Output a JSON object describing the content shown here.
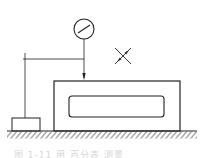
{
  "diagram": {
    "type": "measurement-setup",
    "elements": [
      {
        "id": "dial-indicator",
        "label": "dial indicator"
      },
      {
        "id": "indicator-stand",
        "label": "indicator stand arm"
      },
      {
        "id": "base-block",
        "label": "small base block"
      },
      {
        "id": "workpiece",
        "label": "workpiece with slot"
      },
      {
        "id": "surface-plate",
        "label": "hatched surface plate"
      },
      {
        "id": "cross-mark",
        "label": "X mark with arrows"
      }
    ],
    "colors": {
      "line": "#222222",
      "background": "#ffffff"
    }
  },
  "caption": {
    "text": "图 1-11  用 百分表 测量"
  }
}
